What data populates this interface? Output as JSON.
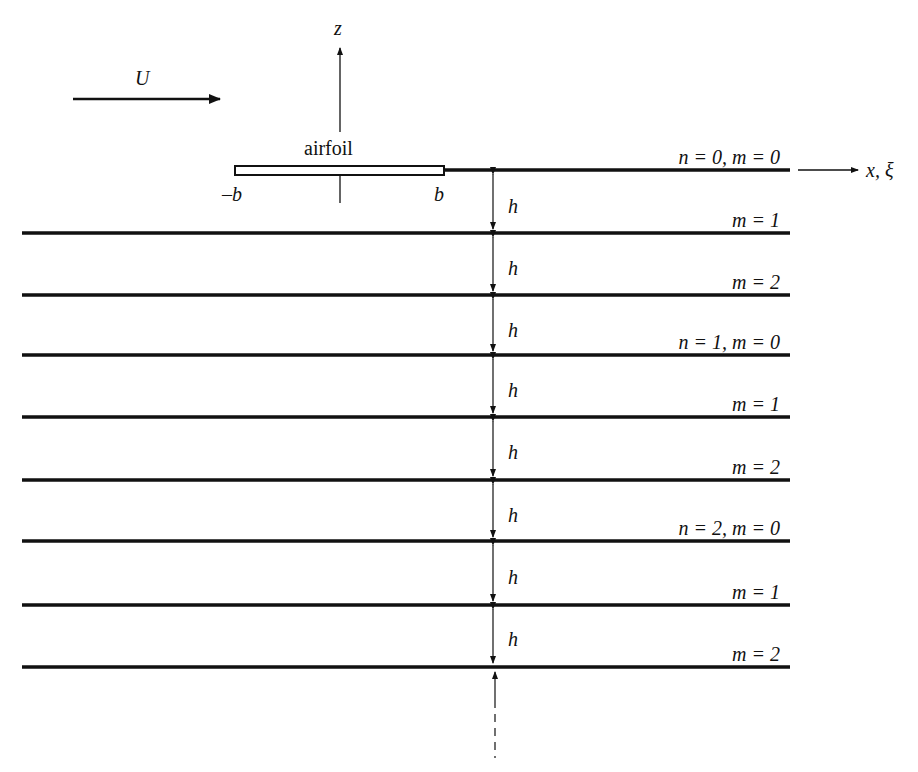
{
  "diagram": {
    "flow": {
      "label": "U"
    },
    "axes": {
      "z_label": "z",
      "x_label": "x, ξ"
    },
    "airfoil": {
      "label": "airfoil",
      "left_label": "–b",
      "right_label": "b"
    },
    "spacing_label": "h",
    "lines": [
      {
        "label": "n = 0, m = 0",
        "y": 170
      },
      {
        "label": "m = 1",
        "y": 233
      },
      {
        "label": "m = 2",
        "y": 295
      },
      {
        "label": "n = 1, m = 0",
        "y": 355
      },
      {
        "label": "m = 1",
        "y": 417
      },
      {
        "label": "m = 2",
        "y": 480
      },
      {
        "label": "n = 2, m = 0",
        "y": 541
      },
      {
        "label": "m = 1",
        "y": 605
      },
      {
        "label": "m = 2",
        "y": 667
      }
    ],
    "h_labels": [
      "h",
      "h",
      "h",
      "h",
      "h",
      "h",
      "h",
      "h"
    ],
    "colors": {
      "line": "#111111",
      "background": "#ffffff"
    }
  }
}
